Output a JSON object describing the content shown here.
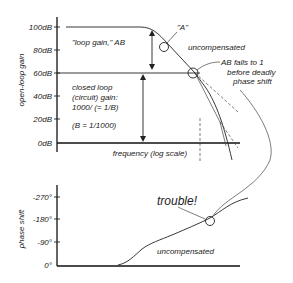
{
  "gain_plot": {
    "ylabel": "open-loop gain",
    "xlabel": "frequency (log scale)",
    "ticks": [
      "100dB",
      "80dB",
      "60dB",
      "40dB",
      "20dB",
      "0dB"
    ],
    "annotations": {
      "A": "\"A\"",
      "uncompensated": "uncompensated",
      "loop_gain": "\"loop gain,\" AB",
      "closed_loop_1": "closed loop",
      "closed_loop_2": "(circuit) gain:",
      "closed_loop_3": "1000/ (= 1/B)",
      "beta": "(B = 1/1000)",
      "ab_falls_1": "AB falls to 1",
      "ab_falls_2": "before deadly",
      "ab_falls_3": "phase shift"
    }
  },
  "phase_plot": {
    "ylabel": "phase shift",
    "ticks": [
      "-270°",
      "-180°",
      "-90°",
      "0°"
    ],
    "annotations": {
      "trouble": "trouble!",
      "uncompensated": "uncompensated"
    }
  }
}
